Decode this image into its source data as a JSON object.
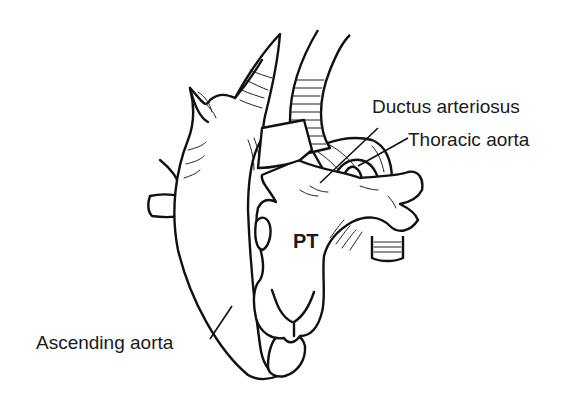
{
  "diagram": {
    "type": "anatomical-line-drawing",
    "labels": {
      "ductus_arteriosus": "Ductus arteriosus",
      "thoracic_aorta": "Thoracic aorta",
      "pulmonary_trunk": "PT",
      "ascending_aorta": "Ascending aorta"
    },
    "colors": {
      "line": "#111111",
      "background": "#ffffff",
      "text": "#1a1a1a"
    }
  }
}
